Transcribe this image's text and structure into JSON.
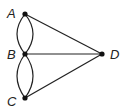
{
  "diagram": {
    "type": "graph",
    "nodes": [
      {
        "id": "A",
        "label": "A",
        "x": 25,
        "y": 14,
        "label_x": 7,
        "label_y": 18
      },
      {
        "id": "B",
        "label": "B",
        "x": 25,
        "y": 54,
        "label_x": 7,
        "label_y": 59
      },
      {
        "id": "C",
        "label": "C",
        "x": 25,
        "y": 98,
        "label_x": 7,
        "label_y": 106
      },
      {
        "id": "D",
        "label": "D",
        "x": 102,
        "y": 54,
        "label_x": 110,
        "label_y": 59
      }
    ],
    "edges": [
      {
        "from": "A",
        "to": "B",
        "style": "curved-left"
      },
      {
        "from": "A",
        "to": "B",
        "style": "curved-right"
      },
      {
        "from": "B",
        "to": "C",
        "style": "curved-left"
      },
      {
        "from": "B",
        "to": "C",
        "style": "curved-right"
      },
      {
        "from": "A",
        "to": "D",
        "style": "straight"
      },
      {
        "from": "B",
        "to": "D",
        "style": "straight"
      },
      {
        "from": "C",
        "to": "D",
        "style": "straight"
      }
    ],
    "colors": {
      "line": "#222222",
      "node": "#111111"
    }
  }
}
